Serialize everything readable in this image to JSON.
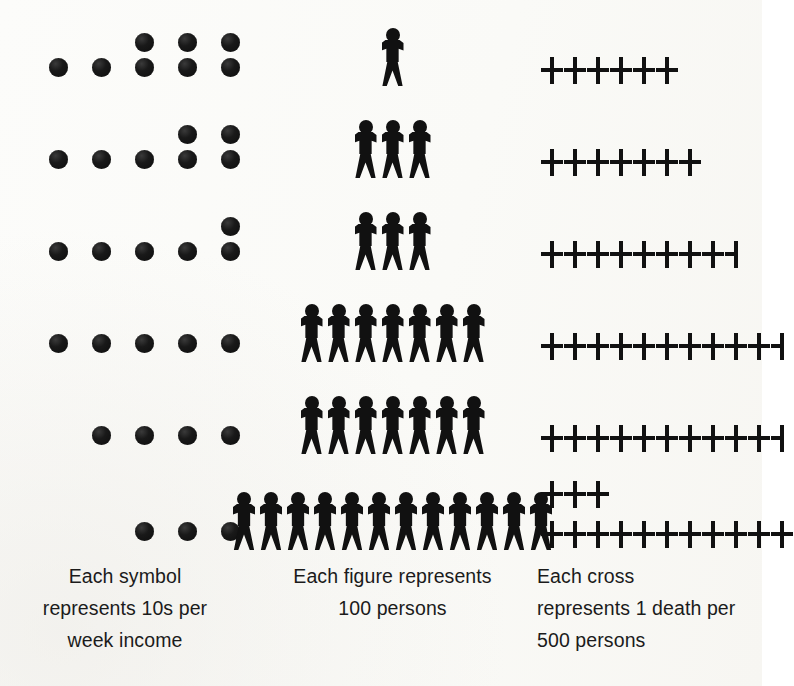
{
  "chart_data": {
    "type": "pictogram",
    "title": "",
    "subtitle": "",
    "background_color": "#fbfbf9",
    "symbol_color": "#111111",
    "legend_position": "bottom",
    "grid": false,
    "columns": [
      {
        "key": "income",
        "symbol": "circle",
        "unit_value": 10,
        "unit_label": "10s per week income",
        "align": "left",
        "caption_lines": [
          "Each symbol",
          "represents 10s per",
          "week income"
        ],
        "caption_align": "center"
      },
      {
        "key": "persons",
        "symbol": "figure",
        "unit_value": 100,
        "unit_label": "100 persons",
        "align": "center",
        "caption_lines": [
          "Each figure represents",
          "100 persons"
        ],
        "caption_align": "center"
      },
      {
        "key": "deaths",
        "symbol": "cross",
        "unit_value": 1,
        "unit_label": "1 death per 500 persons",
        "align": "left",
        "caption_lines": [
          "Each cross",
          "represents 1 death per",
          "500 persons"
        ],
        "caption_align": "left"
      }
    ],
    "rows": [
      {
        "index": 1,
        "income_symbols": 8,
        "income_value": 80,
        "income_lines": [
          {
            "slots": [
              0,
              0,
              1,
              1,
              1
            ]
          },
          {
            "slots": [
              1,
              1,
              1,
              1,
              1
            ]
          }
        ],
        "persons_figures": 1,
        "persons_value": 100,
        "deaths_crosses": 6,
        "deaths_value": 6,
        "deaths_lines": [
          {
            "full": 6,
            "half": 0
          }
        ]
      },
      {
        "index": 2,
        "income_symbols": 7,
        "income_value": 70,
        "income_lines": [
          {
            "slots": [
              0,
              0,
              0,
              1,
              1
            ]
          },
          {
            "slots": [
              1,
              1,
              1,
              1,
              1
            ]
          }
        ],
        "persons_figures": 3,
        "persons_value": 300,
        "deaths_crosses": 7,
        "deaths_value": 7,
        "deaths_lines": [
          {
            "full": 7,
            "half": 0
          }
        ]
      },
      {
        "index": 3,
        "income_symbols": 6,
        "income_value": 60,
        "income_lines": [
          {
            "slots": [
              0,
              0,
              0,
              0,
              1
            ]
          },
          {
            "slots": [
              1,
              1,
              1,
              1,
              1
            ]
          }
        ],
        "persons_figures": 3,
        "persons_value": 300,
        "deaths_crosses": 8.5,
        "deaths_value": 8.5,
        "deaths_lines": [
          {
            "full": 8,
            "half": 1
          }
        ]
      },
      {
        "index": 4,
        "income_symbols": 5,
        "income_value": 50,
        "income_lines": [
          {
            "slots": [
              1,
              1,
              1,
              1,
              1
            ]
          }
        ],
        "persons_figures": 7,
        "persons_value": 700,
        "deaths_crosses": 10.5,
        "deaths_value": 10.5,
        "deaths_lines": [
          {
            "full": 10,
            "half": 1
          }
        ]
      },
      {
        "index": 5,
        "income_symbols": 4,
        "income_value": 40,
        "income_lines": [
          {
            "slots": [
              0,
              1,
              1,
              1,
              1
            ]
          }
        ],
        "persons_figures": 7,
        "persons_value": 700,
        "deaths_crosses": 10.5,
        "deaths_value": 10.5,
        "deaths_lines": [
          {
            "full": 10,
            "half": 1
          }
        ]
      },
      {
        "index": 6,
        "income_symbols": 3,
        "income_value": 30,
        "income_lines": [
          {
            "slots": [
              0,
              0,
              1,
              1,
              1
            ]
          }
        ],
        "persons_figures": 12,
        "persons_value": 1200,
        "deaths_crosses": 14,
        "deaths_value": 14,
        "deaths_lines": [
          {
            "full": 3,
            "half": 0
          },
          {
            "full": 11,
            "half": 0
          }
        ]
      }
    ]
  },
  "captions": {
    "symbols": {
      "line1": "Each symbol",
      "line2": "represents 10s per",
      "line3": "week income"
    },
    "figures": {
      "line1": "Each figure represents",
      "line2": "100 persons"
    },
    "crosses": {
      "line1": "Each cross",
      "line2": "represents 1 death per",
      "line3": "500 persons"
    }
  }
}
